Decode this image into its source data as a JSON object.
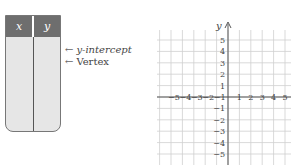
{
  "table": {
    "headers": [
      "x",
      "y"
    ],
    "rows": []
  },
  "annotations": [
    {
      "arrow": "←",
      "label": "y-intercept"
    },
    {
      "arrow": "←",
      "label": "Vertex"
    }
  ],
  "graph": {
    "axis_label_y": "y",
    "x_ticks": [
      "−5",
      "−4",
      "−3",
      "−2",
      "−1",
      "1",
      "2",
      "3",
      "4",
      "5"
    ],
    "y_ticks": [
      "5",
      "4",
      "3",
      "2",
      "1",
      "−1",
      "−2",
      "−3",
      "−4",
      "−5"
    ],
    "range": {
      "x": [
        -5,
        5
      ],
      "y": [
        -5,
        5
      ]
    },
    "grid_color": "#cfcfcf",
    "axis_color": "#555555"
  }
}
